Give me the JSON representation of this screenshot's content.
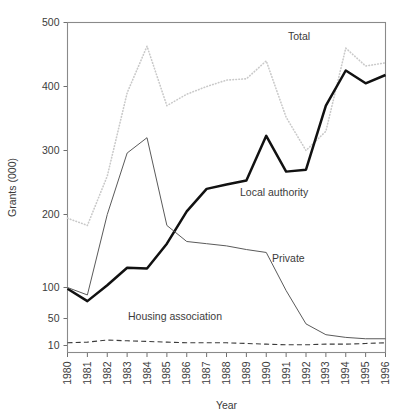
{
  "chart_data": {
    "type": "line",
    "title": "",
    "xlabel": "Year",
    "ylabel": "Grants (000)",
    "x": [
      1980,
      1981,
      1982,
      1983,
      1984,
      1985,
      1986,
      1987,
      1988,
      1989,
      1990,
      1991,
      1992,
      1993,
      1994,
      1995,
      1996
    ],
    "categories": [
      "1980",
      "1981",
      "1982",
      "1983",
      "1984",
      "1985",
      "1986",
      "1987",
      "1988",
      "1989",
      "1990",
      "1991",
      "1992",
      "1993",
      "1994",
      "1995",
      "1996"
    ],
    "y_ticks": [
      10,
      50,
      100,
      200,
      300,
      400,
      500
    ],
    "y_tick_labels": [
      "10",
      "50",
      "100",
      "200",
      "300",
      "400",
      "500"
    ],
    "y_scale_note": "non-linear / compressed below 100",
    "ylim": [
      10,
      500
    ],
    "grid": false,
    "legend": "inline-labels",
    "series": [
      {
        "name": "Total",
        "label": "Total",
        "style": "dotted",
        "color": "#c9c9c9",
        "values": [
          195,
          185,
          260,
          390,
          463,
          370,
          388,
          400,
          410,
          412,
          440,
          352,
          300,
          330,
          460,
          432,
          437
        ]
      },
      {
        "name": "Local authority",
        "label": "Local authority",
        "style": "solid-bold",
        "color": "#111111",
        "values": [
          98,
          78,
          103,
          127,
          126,
          160,
          205,
          240,
          247,
          253,
          323,
          267,
          270,
          370,
          425,
          405,
          418
        ]
      },
      {
        "name": "Private",
        "label": "Private",
        "style": "solid-thin",
        "color": "#5a5a5a",
        "values": [
          100,
          88,
          200,
          296,
          320,
          185,
          163,
          160,
          157,
          152,
          148,
          95,
          42,
          26,
          22,
          20,
          20
        ]
      },
      {
        "name": "Housing association",
        "label": "Housing association",
        "style": "dashed",
        "color": "#3b3b3b",
        "values": [
          14,
          15,
          18,
          17,
          16,
          15,
          14,
          14,
          14,
          13,
          12,
          11,
          11,
          12,
          12,
          13,
          14
        ]
      }
    ],
    "series_label_positions": [
      {
        "name": "Total",
        "x": 288,
        "y": 40
      },
      {
        "name": "Local authority",
        "x": 240,
        "y": 196
      },
      {
        "name": "Private",
        "x": 272,
        "y": 262
      },
      {
        "name": "Housing association",
        "x": 128,
        "y": 320
      }
    ]
  }
}
